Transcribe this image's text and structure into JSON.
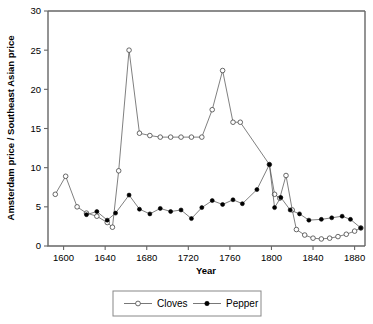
{
  "chart_data": {
    "type": "line",
    "title": "",
    "xlabel": "Year",
    "ylabel": "Amsterdam price / Southeast Asian price",
    "xlim": [
      1585,
      1890
    ],
    "ylim": [
      0,
      30
    ],
    "xticks": [
      1600,
      1640,
      1680,
      1720,
      1760,
      1800,
      1840,
      1880
    ],
    "yticks": [
      0,
      5,
      10,
      15,
      20,
      25,
      30
    ],
    "xtick_labels": [
      "1600",
      "1640",
      "1680",
      "1720",
      "1760",
      "1800",
      "1840",
      "1880"
    ],
    "ytick_labels": [
      "0",
      "5",
      "10",
      "15",
      "20",
      "25",
      "30"
    ],
    "grid": false,
    "legend_position": "bottom-center",
    "series": [
      {
        "name": "Cloves",
        "marker": "open-circle",
        "points": [
          {
            "x": 1592,
            "y": 6.6,
            "connected": false
          },
          {
            "x": 1602,
            "y": 8.9
          },
          {
            "x": 1613,
            "y": 5.0
          },
          {
            "x": 1622,
            "y": 4.2
          },
          {
            "x": 1632,
            "y": 3.8
          },
          {
            "x": 1642,
            "y": 3.0
          },
          {
            "x": 1647,
            "y": 2.4
          },
          {
            "x": 1653,
            "y": 9.6
          },
          {
            "x": 1663,
            "y": 25.0
          },
          {
            "x": 1673,
            "y": 14.4
          },
          {
            "x": 1683,
            "y": 14.1
          },
          {
            "x": 1693,
            "y": 13.9
          },
          {
            "x": 1703,
            "y": 13.9
          },
          {
            "x": 1713,
            "y": 13.9
          },
          {
            "x": 1723,
            "y": 13.9
          },
          {
            "x": 1733,
            "y": 13.9
          },
          {
            "x": 1743,
            "y": 17.4
          },
          {
            "x": 1753,
            "y": 22.4
          },
          {
            "x": 1763,
            "y": 15.8
          },
          {
            "x": 1770,
            "y": 15.8
          },
          {
            "x": 1798,
            "y": 10.4
          },
          {
            "x": 1803,
            "y": 6.6
          },
          {
            "x": 1808,
            "y": 6.1
          },
          {
            "x": 1814,
            "y": 9.0
          },
          {
            "x": 1820,
            "y": 4.6
          },
          {
            "x": 1824,
            "y": 2.1
          },
          {
            "x": 1832,
            "y": 1.4
          },
          {
            "x": 1840,
            "y": 1.0
          },
          {
            "x": 1848,
            "y": 0.9
          },
          {
            "x": 1856,
            "y": 1.0
          },
          {
            "x": 1864,
            "y": 1.2
          },
          {
            "x": 1872,
            "y": 1.5
          },
          {
            "x": 1880,
            "y": 1.9
          },
          {
            "x": 1886,
            "y": 2.3
          }
        ]
      },
      {
        "name": "Pepper",
        "marker": "filled-circle",
        "points": [
          {
            "x": 1622,
            "y": 4.0
          },
          {
            "x": 1632,
            "y": 4.4
          },
          {
            "x": 1642,
            "y": 3.3
          },
          {
            "x": 1650,
            "y": 4.2
          },
          {
            "x": 1663,
            "y": 6.5
          },
          {
            "x": 1673,
            "y": 4.7
          },
          {
            "x": 1683,
            "y": 4.1
          },
          {
            "x": 1693,
            "y": 4.8
          },
          {
            "x": 1703,
            "y": 4.4
          },
          {
            "x": 1713,
            "y": 4.6
          },
          {
            "x": 1723,
            "y": 3.5
          },
          {
            "x": 1733,
            "y": 4.9
          },
          {
            "x": 1743,
            "y": 5.8
          },
          {
            "x": 1753,
            "y": 5.3
          },
          {
            "x": 1763,
            "y": 5.9
          },
          {
            "x": 1772,
            "y": 5.4
          },
          {
            "x": 1786,
            "y": 7.2
          },
          {
            "x": 1798,
            "y": 10.4
          },
          {
            "x": 1803,
            "y": 4.9
          },
          {
            "x": 1809,
            "y": 6.2
          },
          {
            "x": 1818,
            "y": 4.6
          },
          {
            "x": 1827,
            "y": 4.1
          },
          {
            "x": 1836,
            "y": 3.3
          },
          {
            "x": 1848,
            "y": 3.4
          },
          {
            "x": 1858,
            "y": 3.6
          },
          {
            "x": 1868,
            "y": 3.8
          },
          {
            "x": 1876,
            "y": 3.4
          },
          {
            "x": 1886,
            "y": 2.3
          }
        ]
      }
    ],
    "legend": [
      {
        "label": "Cloves",
        "marker": "open-circle"
      },
      {
        "label": "Pepper",
        "marker": "filled-circle"
      }
    ]
  },
  "colors": {
    "background": "#ffffff",
    "axis": "#666666",
    "line": "#555555",
    "marker_fill": "#000000",
    "marker_open": "#ffffff",
    "text": "#000000"
  }
}
